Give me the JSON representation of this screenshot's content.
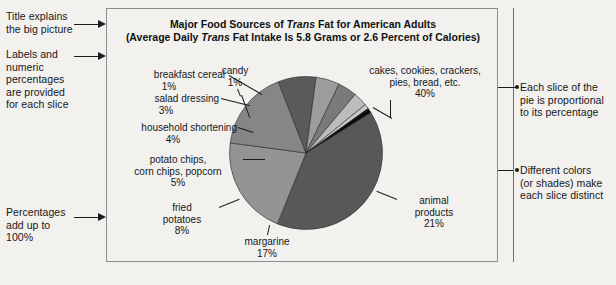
{
  "figure": {
    "title_line1_pre": "Major Food Sources of ",
    "title_line1_em": "Trans",
    "title_line1_post": " Fat for American Adults",
    "title_line2_pre": "(Average Daily ",
    "title_line2_em": "Trans",
    "title_line2_post": " Fat Intake Is 5.8 Grams or 2.6 Percent of Calories)"
  },
  "annotations": {
    "title_note": "Title explains\nthe big picture",
    "labels_note": "Labels and\nnumeric\npercentages\nare provided\nfor each slice",
    "percent_note": "Percentages\nadd up to\n100%",
    "proportional_note": "Each slice of the\npie is proportional\nto its percentage",
    "colors_note": "Different colors\n(or shades) make\neach slice distinct"
  },
  "chart_data": {
    "type": "pie",
    "title": "Major Food Sources of Trans Fat for American Adults",
    "subtitle": "(Average Daily Trans Fat Intake Is 5.8 Grams or 2.6 Percent of Calories)",
    "unit": "percent",
    "total": 100,
    "legend": "none",
    "start_angle_deg": -32,
    "direction": "clockwise",
    "categories": [
      "cakes, cookies, crackers, pies, bread, etc.",
      "animal products",
      "margarine",
      "fried potatoes",
      "potato chips, corn chips, popcorn",
      "household shortening",
      "salad dressing",
      "breakfast cereal",
      "candy"
    ],
    "values": [
      40,
      21,
      17,
      8,
      5,
      4,
      3,
      1,
      1
    ],
    "colors": [
      "#585858",
      "#949494",
      "#868686",
      "#5a5a5a",
      "#9c9c9c",
      "#7a7a7a",
      "#bcbcbc",
      "#c9c9c9",
      "#0b0b0b"
    ],
    "slices": [
      {
        "label": "cakes, cookies, crackers,\npies, bread, etc.",
        "value_label": "40%",
        "value": 40,
        "color": "#585858"
      },
      {
        "label": "animal\nproducts",
        "value_label": "21%",
        "value": 21,
        "color": "#949494"
      },
      {
        "label": "margarine",
        "value_label": "17%",
        "value": 17,
        "color": "#868686"
      },
      {
        "label": "fried\npotatoes",
        "value_label": "8%",
        "value": 8,
        "color": "#5a5a5a"
      },
      {
        "label": "potato chips,\ncorn chips, popcorn",
        "value_label": "5%",
        "value": 5,
        "color": "#9c9c9c"
      },
      {
        "label": "household shortening",
        "value_label": "4%",
        "value": 4,
        "color": "#7a7a7a"
      },
      {
        "label": "salad dressing",
        "value_label": "3%",
        "value": 3,
        "color": "#bcbcbc"
      },
      {
        "label": "breakfast cereal",
        "value_label": "1%",
        "value": 1,
        "color": "#c9c9c9"
      },
      {
        "label": "candy",
        "value_label": "1%",
        "value": 1,
        "color": "#0b0b0b"
      }
    ]
  }
}
